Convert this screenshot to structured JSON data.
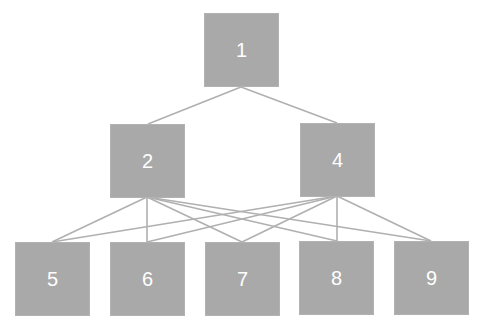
{
  "diagram": {
    "type": "tree-network",
    "node_color": "#a9a9a9",
    "edge_color": "#b0b0b0",
    "text_color": "#ffffff",
    "nodes": [
      {
        "id": "1",
        "label": "1",
        "x": 204,
        "y": 13
      },
      {
        "id": "2",
        "label": "2",
        "x": 110,
        "y": 124
      },
      {
        "id": "4",
        "label": "4",
        "x": 300,
        "y": 123
      },
      {
        "id": "5",
        "label": "5",
        "x": 15,
        "y": 242
      },
      {
        "id": "6",
        "label": "6",
        "x": 110,
        "y": 242
      },
      {
        "id": "7",
        "label": "7",
        "x": 205,
        "y": 242
      },
      {
        "id": "8",
        "label": "8",
        "x": 299,
        "y": 241
      },
      {
        "id": "9",
        "label": "9",
        "x": 394,
        "y": 241
      }
    ],
    "edges": [
      {
        "from": "1",
        "to": "2",
        "x1": 241,
        "y1": 87,
        "x2": 148,
        "y2": 124
      },
      {
        "from": "1",
        "to": "4",
        "x1": 241,
        "y1": 87,
        "x2": 337,
        "y2": 123
      },
      {
        "from": "2",
        "to": "5",
        "x1": 147,
        "y1": 197,
        "x2": 52,
        "y2": 242
      },
      {
        "from": "2",
        "to": "6",
        "x1": 147,
        "y1": 197,
        "x2": 147,
        "y2": 242
      },
      {
        "from": "2",
        "to": "7",
        "x1": 147,
        "y1": 197,
        "x2": 242,
        "y2": 242
      },
      {
        "from": "2",
        "to": "8",
        "x1": 147,
        "y1": 197,
        "x2": 337,
        "y2": 241
      },
      {
        "from": "2",
        "to": "9",
        "x1": 147,
        "y1": 197,
        "x2": 431,
        "y2": 241
      },
      {
        "from": "4",
        "to": "5",
        "x1": 337,
        "y1": 196,
        "x2": 52,
        "y2": 242
      },
      {
        "from": "4",
        "to": "6",
        "x1": 337,
        "y1": 196,
        "x2": 147,
        "y2": 242
      },
      {
        "from": "4",
        "to": "7",
        "x1": 337,
        "y1": 196,
        "x2": 242,
        "y2": 242
      },
      {
        "from": "4",
        "to": "8",
        "x1": 337,
        "y1": 196,
        "x2": 337,
        "y2": 241
      },
      {
        "from": "4",
        "to": "9",
        "x1": 337,
        "y1": 196,
        "x2": 431,
        "y2": 241
      }
    ]
  }
}
